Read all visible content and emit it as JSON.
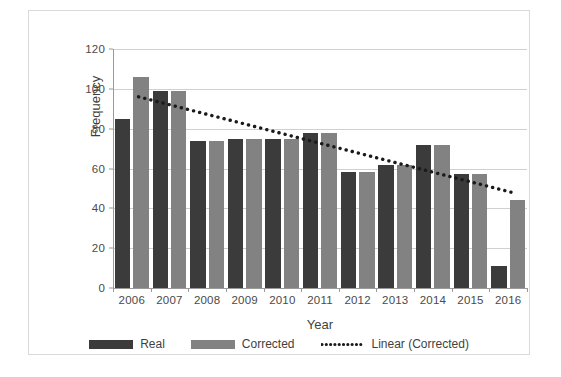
{
  "chart_data": {
    "type": "bar",
    "title": "",
    "xlabel": "Year",
    "ylabel": "Frequency",
    "categories": [
      "2006",
      "2007",
      "2008",
      "2009",
      "2010",
      "2011",
      "2012",
      "2013",
      "2014",
      "2015",
      "2016"
    ],
    "series": [
      {
        "name": "Real",
        "color": "#3b3b3b",
        "values": [
          85,
          99,
          74,
          75,
          75,
          78,
          58,
          62,
          72,
          57,
          11
        ]
      },
      {
        "name": "Corrected",
        "color": "#828282",
        "values": [
          106,
          99,
          74,
          75,
          75,
          78,
          58,
          62,
          72,
          57,
          44
        ]
      }
    ],
    "trendline": {
      "name": "Linear (Corrected)",
      "color": "#1a1a1a",
      "style": "dotted",
      "start_value": 96,
      "end_value": 48
    },
    "ylim": [
      0,
      120
    ],
    "yticks": [
      0,
      20,
      40,
      60,
      80,
      100,
      120
    ],
    "ytick_labels": [
      "0",
      "20",
      "40",
      "60",
      "80",
      "100",
      "120"
    ],
    "grid": true,
    "legend_position": "bottom"
  },
  "legend": {
    "items": [
      {
        "label": "Real",
        "marker": "swatch-dark"
      },
      {
        "label": "Corrected",
        "marker": "swatch-gray"
      },
      {
        "label": "Linear (Corrected)",
        "marker": "dotted-line"
      }
    ]
  },
  "axes": {
    "x_title": "Year",
    "y_title": "Frequency"
  }
}
